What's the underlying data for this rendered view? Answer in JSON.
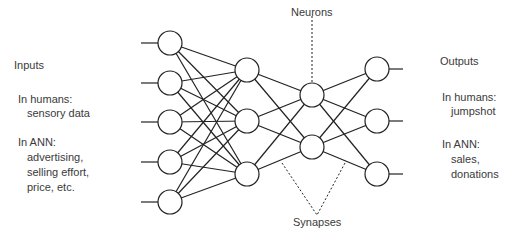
{
  "left": {
    "title": "Inputs",
    "humans_label": "In humans:",
    "humans_value": "sensory data",
    "ann_label": "In ANN:",
    "ann_values": [
      "advertising,",
      "selling effort,",
      "price, etc."
    ]
  },
  "right": {
    "title": "Outputs",
    "humans_label": "In humans:",
    "humans_value": "jumpshot",
    "ann_label": "In ANN:",
    "ann_values": [
      "sales,",
      "donations"
    ]
  },
  "annotations": {
    "neurons": "Neurons",
    "synapses": "Synapses"
  },
  "network": {
    "layers": [
      {
        "name": "input",
        "x": 170,
        "ys": [
          43,
          83,
          122,
          162,
          202
        ]
      },
      {
        "name": "hidden1",
        "x": 247,
        "ys": [
          70,
          121,
          174
        ]
      },
      {
        "name": "hidden2",
        "x": 312,
        "ys": [
          95,
          147
        ]
      },
      {
        "name": "output",
        "x": 377,
        "ys": [
          69,
          121,
          174
        ]
      }
    ],
    "node_radius": 12
  }
}
